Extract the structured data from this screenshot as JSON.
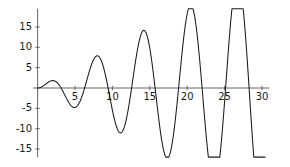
{
  "chart_data": {
    "type": "line",
    "title": "",
    "subtitle": "",
    "xlabel": "",
    "ylabel": "",
    "xlim": [
      -0.6,
      31.0
    ],
    "ylim": [
      -17.0,
      19.5
    ],
    "grid": false,
    "legend": null,
    "axis_style": "crossed-axes-at-origin",
    "line_color": "#1a1a1a",
    "axis_color": "#555555",
    "background_color": "#ffffff",
    "xticks": [
      5,
      10,
      15,
      20,
      25,
      30
    ],
    "xtick_labels": [
      "5",
      "10",
      "15",
      "20",
      "25",
      "30"
    ],
    "yticks": [
      -15,
      -10,
      -5,
      5,
      10,
      15
    ],
    "ytick_labels": [
      "-15",
      "-10",
      "-5",
      "5",
      "10",
      "15"
    ],
    "function": "t * sin(t)",
    "x_start": 0,
    "x_end": 30.4,
    "series": [
      {
        "name": "t sin(t)",
        "x": [
          0,
          0.5,
          1,
          1.5,
          2,
          2.5,
          3,
          3.5,
          4,
          4.5,
          5,
          5.5,
          6,
          6.5,
          7,
          7.5,
          8,
          8.5,
          9,
          9.5,
          10,
          10.5,
          11,
          11.5,
          12,
          12.5,
          13,
          13.5,
          14,
          14.5,
          15,
          15.5,
          16,
          16.5,
          17,
          17.5,
          18,
          18.5,
          19,
          19.5,
          20,
          20.5,
          21,
          21.5,
          22,
          22.5,
          23,
          23.5,
          24,
          24.5,
          25,
          25.5,
          26,
          26.5,
          27,
          27.5,
          28,
          28.5,
          29,
          29.5,
          30,
          30.4
        ],
        "y": [
          0.0,
          0.24,
          0.84,
          1.5,
          1.82,
          1.5,
          0.42,
          -1.23,
          -3.03,
          -4.4,
          -4.79,
          -3.88,
          -1.68,
          1.42,
          4.6,
          6.97,
          7.92,
          7.22,
          5.08,
          2.02,
          -5.44,
          -10.0,
          -11.0,
          -10.44,
          -6.44,
          -0.09,
          5.49,
          10.68,
          13.89,
          13.49,
          9.75,
          3.71,
          -2.52,
          -8.5,
          -16.31,
          -11.36,
          -13.42,
          -5.27,
          2.93,
          10.64,
          18.26,
          19.04,
          17.49,
          11.83,
          0.02,
          -12.36,
          -19.86,
          -19.35,
          -13.1,
          -3.31,
          6.42,
          13.0,
          17.64,
          16.33,
          10.33,
          2.1,
          7.74,
          14.17,
          18.77,
          19.03,
          15.5,
          9.65
        ]
      }
    ],
    "curve_features": {
      "description": "Oscillation with linearly growing amplitude, period approximately 6.28",
      "peaks": [
        {
          "x": 2.0,
          "y": 1.8
        },
        {
          "x": 8.0,
          "y": 7.9
        },
        {
          "x": 14.2,
          "y": 14.1
        },
        {
          "x": 20.5,
          "y": 20.4
        },
        {
          "x": 26.8,
          "y": 26.7
        }
      ],
      "troughs": [
        {
          "x": 4.9,
          "y": -4.8
        },
        {
          "x": 11.1,
          "y": -11.0
        },
        {
          "x": 17.3,
          "y": -17.3
        },
        {
          "x": 23.5,
          "y": -23.5
        },
        {
          "x": 29.8,
          "y": -29.8
        }
      ],
      "visible_peaks": [
        {
          "x": 2.7,
          "y": 2.7
        },
        {
          "x": 9.3,
          "y": 5.7
        },
        {
          "x": 16.0,
          "y": 10.0
        },
        {
          "x": 22.3,
          "y": 14.0
        },
        {
          "x": 28.5,
          "y": 18.0
        }
      ],
      "visible_troughs": [
        {
          "x": 6.5,
          "y": -4.4
        },
        {
          "x": 12.7,
          "y": -8.1
        },
        {
          "x": 19.2,
          "y": -12.0
        },
        {
          "x": 25.5,
          "y": -15.5
        }
      ],
      "zero_crossings": [
        0,
        4.0,
        7.5,
        10.8,
        14.0,
        17.3,
        20.5,
        23.6,
        26.9,
        30.1
      ]
    }
  }
}
